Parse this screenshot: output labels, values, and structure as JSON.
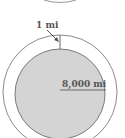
{
  "diagram": {
    "labels": {
      "gap": "1 mi",
      "radius": "8,000 mi"
    },
    "colors": {
      "stroke": "#8a8a8a",
      "inner_fill": "#d4d4d4",
      "inner_stroke": "#7a7a7a",
      "text": "#555555",
      "background": "#ffffff"
    },
    "shapes": {
      "outer_circle": {
        "cx": 60,
        "cy": 92,
        "r": 57
      },
      "inner_circle": {
        "cx": 60,
        "cy": 94,
        "r": 45
      },
      "radius_line": {
        "x1": 60,
        "y1": 90,
        "x2": 106,
        "y2": 90
      },
      "gap_tick": {
        "x1": 60,
        "y1": 35,
        "x2": 60,
        "y2": 49
      },
      "arrow": {
        "x1": 47,
        "y1": 30,
        "x2": 58,
        "y2": 41
      }
    }
  }
}
